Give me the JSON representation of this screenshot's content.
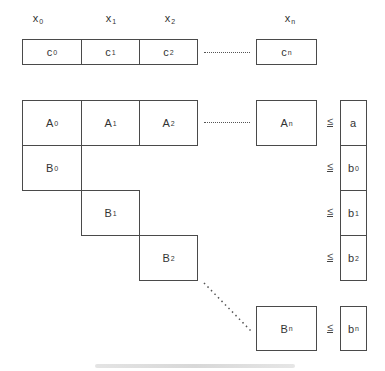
{
  "variables": [
    {
      "base": "x",
      "sub": "0",
      "x": 38
    },
    {
      "base": "x",
      "sub": "1",
      "x": 111
    },
    {
      "base": "x",
      "sub": "2",
      "x": 170
    },
    {
      "base": "x",
      "sub": "n",
      "x": 290
    }
  ],
  "cost_row": [
    {
      "base": "c",
      "sub": "0"
    },
    {
      "base": "c",
      "sub": "1"
    },
    {
      "base": "c",
      "sub": "2"
    },
    {
      "base": "c",
      "sub": "n"
    }
  ],
  "constraint_row_A": [
    {
      "base": "A",
      "sub": "0"
    },
    {
      "base": "A",
      "sub": "1"
    },
    {
      "base": "A",
      "sub": "2"
    },
    {
      "base": "A",
      "sub": "n"
    }
  ],
  "diagonal_blocks": [
    {
      "base": "B",
      "sub": "0"
    },
    {
      "base": "B",
      "sub": "1"
    },
    {
      "base": "B",
      "sub": "2"
    },
    {
      "base": "B",
      "sub": "n"
    }
  ],
  "relation_symbol": "≤",
  "rhs": [
    {
      "base": "a",
      "sub": ""
    },
    {
      "base": "b",
      "sub": "0"
    },
    {
      "base": "b",
      "sub": "1"
    },
    {
      "base": "b",
      "sub": "2"
    },
    {
      "base": "b",
      "sub": "n"
    }
  ],
  "colors": {
    "line": "#4a4a4a",
    "text": "#333333",
    "background": "#ffffff"
  }
}
